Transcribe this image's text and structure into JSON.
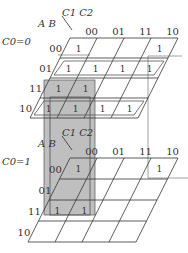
{
  "diagram": {
    "type": "3D Karnaugh map (5 variables)",
    "col_var_label": "C1 C2",
    "row_var_label": "A B",
    "col_labels": [
      "00",
      "01",
      "11",
      "10"
    ],
    "row_labels": [
      "00",
      "01",
      "11",
      "10"
    ],
    "layers": [
      {
        "label": "C0=0",
        "cells": [
          [
            "1",
            "",
            "",
            "1"
          ],
          [
            "1",
            "1",
            "1",
            "1"
          ],
          [
            "1",
            "1",
            "",
            ""
          ],
          [
            "1",
            "1",
            "1",
            "1"
          ]
        ]
      },
      {
        "label": "C0=1",
        "cells": [
          [
            "1",
            "",
            "",
            "1"
          ],
          [
            "",
            "",
            "",
            ""
          ],
          [
            "1",
            "1",
            "",
            ""
          ],
          [
            "",
            "",
            "",
            ""
          ]
        ]
      }
    ],
    "groupings": [
      "row 01 of layer C0=0 (all four cells)",
      "row 10 of layer C0=0 (all four cells)",
      "shaded column box spanning columns 00,01 rows 11 across both layers",
      "corner box linking cell (00,10) of both layers"
    ],
    "colors": {
      "line": "#333333",
      "shade": "#8a8a8a",
      "group_outline": "#555555"
    }
  }
}
